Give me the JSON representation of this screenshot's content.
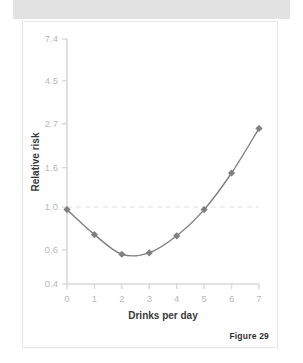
{
  "page": {
    "background_color": "#ffffff",
    "top_band_color": "#e2e2e2",
    "card_border_color": "#e6e6e6"
  },
  "figure": {
    "caption": "Figure 29"
  },
  "chart_data": {
    "type": "line",
    "title": "",
    "subtitle": "",
    "xlabel": "Drinks per day",
    "ylabel": "Relative risk",
    "x": [
      0,
      1,
      2,
      3,
      4,
      5,
      6,
      7
    ],
    "xticklabels": [
      "0",
      "1",
      "2",
      "3",
      "4",
      "5",
      "6",
      "7"
    ],
    "xlim": [
      0,
      7
    ],
    "yticks": [
      0.4,
      0.6,
      1.0,
      1.6,
      2.7,
      4.5,
      7.4
    ],
    "yticklabels": [
      "0.4",
      "0.6",
      "1.0",
      "1.6",
      "2.7",
      "4.5",
      "7.4"
    ],
    "ylim": [
      0.4,
      7.4
    ],
    "yscale": "log",
    "grid": false,
    "legend": null,
    "series": [
      {
        "name": "Relative risk",
        "values": [
          0.97,
          0.72,
          0.57,
          0.58,
          0.71,
          0.97,
          1.5,
          2.55
        ],
        "color": "#808080",
        "marker": "diamond",
        "line_width": 1.4
      }
    ],
    "reference_lines": [
      {
        "name": "baseline-risk",
        "orientation": "horizontal",
        "value": 1.0,
        "style": "dashed",
        "color": "#e7dede"
      }
    ],
    "axis_color": "#d8d8d8",
    "tick_label_color": "#b9b9b9",
    "axis_title_color": "#3a3a3a"
  }
}
